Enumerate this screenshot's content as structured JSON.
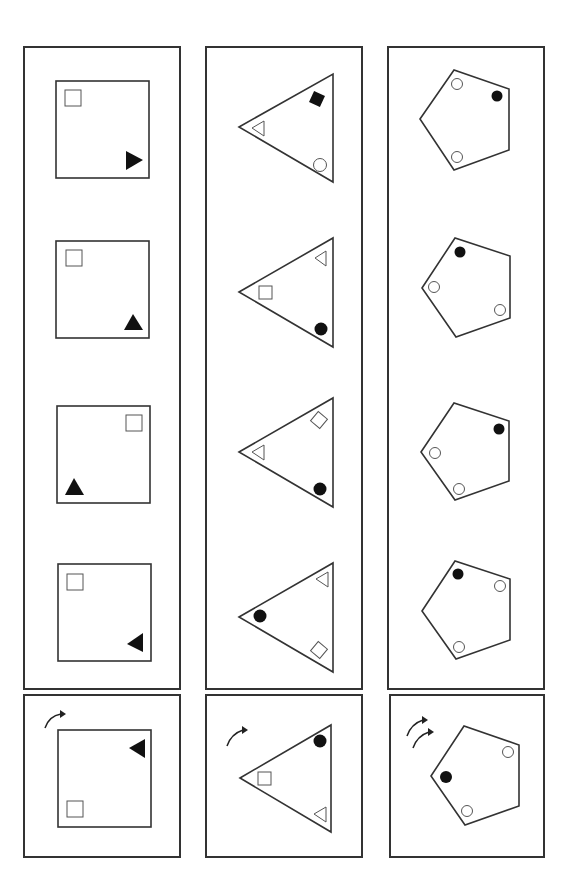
{
  "columns": [
    {
      "name": "square-column",
      "shape": "square",
      "sequence": [
        {
          "outline": "square",
          "items": [
            {
              "type": "square",
              "fill": "white",
              "pos": "top-left"
            },
            {
              "type": "triangle",
              "fill": "black",
              "pos": "bottom-right",
              "pointing": "right"
            }
          ]
        },
        {
          "outline": "square",
          "items": [
            {
              "type": "square",
              "fill": "white",
              "pos": "top-left"
            },
            {
              "type": "triangle",
              "fill": "black",
              "pos": "bottom-right",
              "pointing": "up"
            }
          ]
        },
        {
          "outline": "square",
          "items": [
            {
              "type": "square",
              "fill": "white",
              "pos": "top-right"
            },
            {
              "type": "triangle",
              "fill": "black",
              "pos": "bottom-left",
              "pointing": "up"
            }
          ]
        },
        {
          "outline": "square",
          "items": [
            {
              "type": "square",
              "fill": "white",
              "pos": "top-left"
            },
            {
              "type": "triangle",
              "fill": "black",
              "pos": "bottom-right",
              "pointing": "left"
            }
          ]
        }
      ],
      "answer": {
        "rotation_arrows": 1,
        "outline": "square",
        "items": [
          {
            "type": "square",
            "fill": "white",
            "pos": "bottom-left"
          },
          {
            "type": "triangle",
            "fill": "black",
            "pos": "top-right",
            "pointing": "left"
          }
        ]
      }
    },
    {
      "name": "triangle-column",
      "shape": "triangle",
      "sequence": [
        {
          "outline": "triangle",
          "items": [
            {
              "type": "square",
              "fill": "black",
              "pos": "top",
              "rotated": true
            },
            {
              "type": "triangle",
              "fill": "white",
              "pos": "left"
            },
            {
              "type": "circle",
              "fill": "white",
              "pos": "bottom"
            }
          ]
        },
        {
          "outline": "triangle",
          "items": [
            {
              "type": "triangle",
              "fill": "white",
              "pos": "top"
            },
            {
              "type": "square",
              "fill": "white",
              "pos": "left"
            },
            {
              "type": "circle",
              "fill": "black",
              "pos": "bottom"
            }
          ]
        },
        {
          "outline": "triangle",
          "items": [
            {
              "type": "square",
              "fill": "white",
              "pos": "top",
              "rotated": true
            },
            {
              "type": "triangle",
              "fill": "white",
              "pos": "left"
            },
            {
              "type": "circle",
              "fill": "black",
              "pos": "bottom"
            }
          ]
        },
        {
          "outline": "triangle",
          "items": [
            {
              "type": "triangle",
              "fill": "white",
              "pos": "top"
            },
            {
              "type": "circle",
              "fill": "black",
              "pos": "left"
            },
            {
              "type": "square",
              "fill": "white",
              "pos": "bottom",
              "rotated": true
            }
          ]
        }
      ],
      "answer": {
        "rotation_arrows": 1,
        "outline": "triangle",
        "items": [
          {
            "type": "circle",
            "fill": "black",
            "pos": "top"
          },
          {
            "type": "square",
            "fill": "white",
            "pos": "left"
          },
          {
            "type": "triangle",
            "fill": "white",
            "pos": "bottom"
          }
        ]
      }
    },
    {
      "name": "pentagon-column",
      "shape": "pentagon",
      "sequence": [
        {
          "outline": "pentagon",
          "items": [
            {
              "type": "circle",
              "fill": "white",
              "pos": "top"
            },
            {
              "type": "circle",
              "fill": "black",
              "pos": "upper-right"
            },
            {
              "type": "circle",
              "fill": "white",
              "pos": "bottom"
            }
          ]
        },
        {
          "outline": "pentagon",
          "items": [
            {
              "type": "circle",
              "fill": "black",
              "pos": "top"
            },
            {
              "type": "circle",
              "fill": "white",
              "pos": "left"
            },
            {
              "type": "circle",
              "fill": "white",
              "pos": "lower-right"
            }
          ]
        },
        {
          "outline": "pentagon",
          "items": [
            {
              "type": "circle",
              "fill": "black",
              "pos": "upper-right"
            },
            {
              "type": "circle",
              "fill": "white",
              "pos": "left"
            },
            {
              "type": "circle",
              "fill": "white",
              "pos": "bottom"
            }
          ]
        },
        {
          "outline": "pentagon",
          "items": [
            {
              "type": "circle",
              "fill": "black",
              "pos": "top"
            },
            {
              "type": "circle",
              "fill": "white",
              "pos": "upper-right"
            },
            {
              "type": "circle",
              "fill": "white",
              "pos": "bottom"
            }
          ]
        }
      ],
      "answer": {
        "rotation_arrows": 2,
        "outline": "pentagon",
        "items": [
          {
            "type": "circle",
            "fill": "white",
            "pos": "upper-right"
          },
          {
            "type": "circle",
            "fill": "black",
            "pos": "left"
          },
          {
            "type": "circle",
            "fill": "white",
            "pos": "bottom"
          }
        ]
      }
    }
  ],
  "colors": {
    "stroke": "#333333",
    "fill_black": "#111111",
    "fill_white": "#ffffff"
  }
}
